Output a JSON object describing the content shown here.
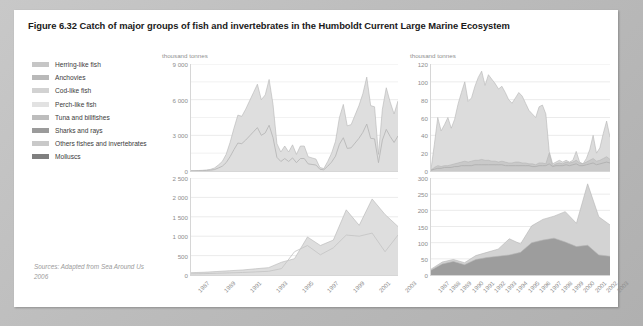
{
  "figure": {
    "title": "Figure 6.32 Catch of major groups of fish and invertebrates in the Humboldt Current Large Marine Ecosystem",
    "source": "Sources: Adapted from Sea Around Us 2006"
  },
  "legend": {
    "items": [
      {
        "label": "Herring-like fish",
        "color": "#c6c6c6"
      },
      {
        "label": "Anchovies",
        "color": "#b9b9b9"
      },
      {
        "label": "Cod-like fish",
        "color": "#d2d2d2"
      },
      {
        "label": "Perch-like fish",
        "color": "#e2e2e2"
      },
      {
        "label": "Tuna and billfishes",
        "color": "#bdbdbd"
      },
      {
        "label": "Sharks and rays",
        "color": "#9b9b9b"
      },
      {
        "label": "Others fishes and invertebrates",
        "color": "#c9c9c9"
      },
      {
        "label": "Molluscs",
        "color": "#7f7f7f"
      }
    ]
  },
  "chart_data": [
    {
      "id": "top-left",
      "type": "area",
      "title": "",
      "ylabel": "thousand tonnes",
      "xlabel": "",
      "ylim": [
        0,
        9000
      ],
      "yticks": [
        0,
        3000,
        6000,
        9000
      ],
      "yticklabels": [
        "0",
        "3 000",
        "6 000",
        "9 000"
      ],
      "minor_gridlines": [
        1500,
        4500,
        7500
      ],
      "grid": true,
      "legend_position": "external-left",
      "x": [
        1950,
        1951,
        1952,
        1953,
        1954,
        1955,
        1956,
        1957,
        1958,
        1959,
        1960,
        1961,
        1962,
        1963,
        1964,
        1965,
        1966,
        1967,
        1968,
        1969,
        1970,
        1971,
        1972,
        1973,
        1974,
        1975,
        1976,
        1977,
        1978,
        1979,
        1980,
        1981,
        1982,
        1983,
        1984,
        1985,
        1986,
        1987,
        1988,
        1989,
        1990,
        1991,
        1992,
        1993,
        1994,
        1995,
        1996,
        1997,
        1998,
        1999,
        2000,
        2001,
        2002,
        2003
      ],
      "xticklabels": [],
      "series": [
        {
          "name": "Anchovies",
          "color": "#dedede",
          "kind": "area",
          "values": [
            20,
            25,
            40,
            60,
            90,
            140,
            250,
            500,
            800,
            1400,
            2400,
            3600,
            4700,
            4600,
            5200,
            5900,
            6600,
            7300,
            6000,
            6400,
            7700,
            5600,
            2300,
            1600,
            2100,
            1600,
            2200,
            1400,
            2100,
            2100,
            1200,
            1100,
            1000,
            300,
            200,
            800,
            1500,
            2500,
            4500,
            5600,
            3800,
            3900,
            4700,
            5500,
            6500,
            7900,
            5500,
            5400,
            1400,
            5200,
            7000,
            5800,
            4800,
            5900
          ],
          "approx": true
        },
        {
          "name": "Herring-like fish (total pelagic line)",
          "color": "#b8b8b8",
          "kind": "line",
          "values": [
            10,
            12,
            20,
            30,
            45,
            70,
            120,
            250,
            400,
            700,
            1200,
            1800,
            2350,
            2300,
            2600,
            2950,
            3300,
            3650,
            3000,
            3200,
            3850,
            2800,
            1150,
            800,
            1050,
            800,
            1100,
            700,
            1050,
            1050,
            600,
            550,
            500,
            150,
            100,
            400,
            750,
            1250,
            2250,
            2800,
            1900,
            1950,
            2350,
            2750,
            3250,
            3950,
            2750,
            2700,
            700,
            2600,
            3500,
            2900,
            2400,
            2950
          ],
          "approx": true
        }
      ]
    },
    {
      "id": "top-right",
      "type": "area",
      "title": "",
      "ylabel": "thousand tonnes",
      "xlabel": "",
      "ylim": [
        0,
        120
      ],
      "yticks": [
        0,
        20,
        40,
        60,
        80,
        100,
        120
      ],
      "yticklabels": [
        "0",
        "20",
        "40",
        "60",
        "80",
        "100",
        "120"
      ],
      "grid": true,
      "x": [
        1950,
        1951,
        1952,
        1953,
        1954,
        1955,
        1956,
        1957,
        1958,
        1959,
        1960,
        1961,
        1962,
        1963,
        1964,
        1965,
        1966,
        1967,
        1968,
        1969,
        1970,
        1971,
        1972,
        1973,
        1974,
        1975,
        1976,
        1977,
        1978,
        1979,
        1980,
        1981,
        1982,
        1983,
        1984,
        1985,
        1986,
        1987,
        1988,
        1989,
        1990,
        1991,
        1992,
        1993,
        1994,
        1995,
        1996,
        1997,
        1998,
        1999,
        2000,
        2001,
        2002,
        2003
      ],
      "xticklabels": [],
      "series": [
        {
          "name": "Cod-like fish",
          "color": "#dcdcdc",
          "kind": "area",
          "values": [
            2,
            30,
            60,
            45,
            52,
            60,
            48,
            58,
            75,
            88,
            100,
            78,
            82,
            95,
            105,
            112,
            96,
            108,
            103,
            98,
            92,
            95,
            88,
            80,
            76,
            82,
            88,
            84,
            76,
            68,
            64,
            60,
            72,
            74,
            64,
            22,
            8,
            10,
            12,
            10,
            12,
            10,
            12,
            22,
            10,
            8,
            14,
            24,
            40,
            20,
            26,
            42,
            56,
            38,
            44,
            30,
            22,
            12,
            10,
            8,
            12,
            16,
            20,
            34
          ],
          "approx": true
        },
        {
          "name": "Perch-like fish",
          "color": "#c9c9c9",
          "kind": "area",
          "values": [
            1,
            4,
            6,
            5,
            6,
            6,
            7,
            8,
            9,
            10,
            11,
            10,
            11,
            12,
            12,
            13,
            12,
            12,
            11,
            11,
            10,
            11,
            10,
            9,
            9,
            10,
            10,
            9,
            9,
            8,
            8,
            7,
            9,
            9,
            8,
            20,
            6,
            8,
            9,
            8,
            10,
            9,
            10,
            12,
            9,
            8,
            10,
            12,
            14,
            11,
            12,
            14,
            16,
            13,
            14,
            12,
            11,
            9,
            9,
            8,
            10,
            11,
            12,
            14
          ],
          "approx": true
        },
        {
          "name": "Tuna and billfishes",
          "color": "#b0b0b0",
          "kind": "line",
          "values": [
            1,
            2,
            3,
            3,
            4,
            4,
            4,
            5,
            5,
            6,
            6,
            6,
            6,
            7,
            7,
            7,
            7,
            7,
            7,
            7,
            7,
            7,
            6,
            6,
            6,
            6,
            6,
            6,
            6,
            6,
            5,
            5,
            6,
            6,
            6,
            8,
            5,
            6,
            6,
            6,
            7,
            6,
            7,
            8,
            6,
            6,
            7,
            8,
            9,
            7,
            8,
            9,
            10,
            9,
            9,
            8,
            8,
            7,
            7,
            6,
            7,
            8,
            9,
            10
          ],
          "approx": true
        }
      ]
    },
    {
      "id": "bottom-left",
      "type": "area",
      "title": "",
      "ylabel": "",
      "xlabel": "",
      "ylim": [
        0,
        2500
      ],
      "yticks": [
        0,
        500,
        1000,
        1500,
        2000,
        2500
      ],
      "yticklabels": [
        "0",
        "500",
        "1 000",
        "1 500",
        "2 000",
        "2 500"
      ],
      "grid": true,
      "x": [
        1987,
        1988,
        1989,
        1990,
        1991,
        1992,
        1993,
        1994,
        1995,
        1996,
        1997,
        1998,
        1999,
        2000,
        2001,
        2002,
        2003
      ],
      "xticklabels": [
        "1987",
        "",
        "1989",
        "",
        "1991",
        "",
        "1993",
        "",
        "1995",
        "",
        "1997",
        "",
        "1999",
        "",
        "2001",
        "",
        "2003"
      ],
      "series": [
        {
          "name": "Others fishes and invertebrates",
          "color": "#dedede",
          "kind": "area",
          "values": [
            60,
            70,
            90,
            110,
            130,
            160,
            190,
            330,
            420,
            980,
            760,
            900,
            1680,
            1280,
            1960,
            1560,
            1250
          ],
          "approx": true
        },
        {
          "name": "Molluscs",
          "color": "#c6c6c6",
          "kind": "line",
          "values": [
            30,
            35,
            45,
            55,
            65,
            80,
            95,
            165,
            600,
            760,
            520,
            700,
            1030,
            1000,
            1080,
            600,
            1030
          ],
          "approx": true
        }
      ]
    },
    {
      "id": "bottom-right",
      "type": "area",
      "title": "",
      "ylabel": "",
      "xlabel": "",
      "ylim": [
        0,
        300
      ],
      "yticks": [
        0,
        50,
        100,
        150,
        200,
        250,
        300
      ],
      "yticklabels": [
        "0",
        "50",
        "100",
        "150",
        "200",
        "250",
        "300"
      ],
      "grid": true,
      "x": [
        1987,
        1988,
        1989,
        1990,
        1991,
        1992,
        1993,
        1994,
        1995,
        1996,
        1997,
        1998,
        1999,
        2000,
        2001,
        2002,
        2003
      ],
      "xticklabels": [
        "1987",
        "1988",
        "1989",
        "1990",
        "1991",
        "1992",
        "1993",
        "1994",
        "1995",
        "1996",
        "1997",
        "1998",
        "1999",
        "2000",
        "2001",
        "2002",
        "2003"
      ],
      "series": [
        {
          "name": "Others fishes and invertebrates",
          "color": "#d3d3d3",
          "kind": "area",
          "values": [
            18,
            40,
            48,
            38,
            60,
            70,
            80,
            112,
            96,
            152,
            172,
            182,
            196,
            160,
            282,
            180,
            155
          ],
          "approx": true
        },
        {
          "name": "Molluscs",
          "color": "#9d9d9d",
          "kind": "area",
          "values": [
            15,
            34,
            42,
            32,
            48,
            54,
            58,
            62,
            70,
            100,
            108,
            114,
            102,
            88,
            92,
            62,
            58
          ],
          "approx": true
        }
      ]
    }
  ]
}
